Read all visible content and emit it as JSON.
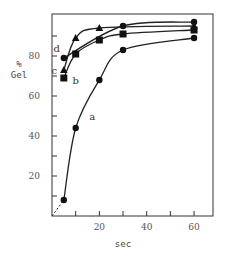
{
  "chart_data": {
    "type": "line",
    "title": "",
    "xlabel": "sec",
    "ylabel_line1": "%",
    "ylabel_line2": "Gel",
    "xlim": [
      0,
      68
    ],
    "ylim": [
      0,
      101
    ],
    "xticks": [
      10,
      20,
      30,
      40,
      50,
      60
    ],
    "xtick_labels": [
      {
        "value": 20,
        "label": "20"
      },
      {
        "value": 40,
        "label": "40"
      },
      {
        "value": 60,
        "label": "60"
      }
    ],
    "yticks": [
      10,
      20,
      30,
      40,
      50,
      60,
      70,
      80,
      90
    ],
    "ytick_labels": [
      {
        "value": 20,
        "label": "20"
      },
      {
        "value": 40,
        "label": "40"
      },
      {
        "value": 60,
        "label": "60"
      },
      {
        "value": 80,
        "label": "80"
      }
    ],
    "grid": false,
    "series": [
      {
        "name": "a",
        "marker": "circle",
        "x": [
          5,
          10,
          20,
          30,
          60
        ],
        "y": [
          8,
          44,
          68,
          83,
          89
        ],
        "label_at": [
          17,
          48
        ],
        "extrapolated_to_origin": true
      },
      {
        "name": "b",
        "marker": "square",
        "x": [
          5,
          10,
          20,
          30,
          60
        ],
        "y": [
          69,
          81,
          88,
          91,
          93
        ],
        "label_at": [
          10,
          66
        ]
      },
      {
        "name": "c",
        "marker": "triangle",
        "x": [
          5,
          10,
          20,
          60
        ],
        "y": [
          73,
          89,
          94,
          95
        ],
        "label_at": [
          1,
          71
        ]
      },
      {
        "name": "d",
        "marker": "circle",
        "x": [
          5,
          30,
          60
        ],
        "y": [
          79,
          95,
          97
        ],
        "label_at": [
          2,
          82
        ]
      }
    ]
  }
}
